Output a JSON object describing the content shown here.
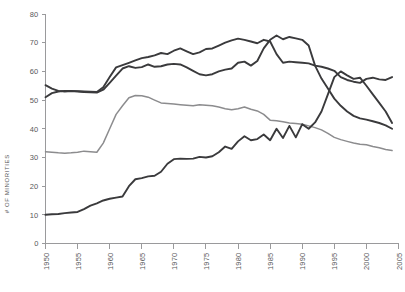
{
  "chart_data": {
    "type": "line",
    "title": "",
    "xlabel": "",
    "ylabel": "# OF MINORITIES",
    "xlim": [
      1950,
      2005
    ],
    "ylim": [
      0,
      80
    ],
    "grid": false,
    "legend": "none",
    "xticks": [
      "1950",
      "1955",
      "1960",
      "1965",
      "1970",
      "1975",
      "1980",
      "1985",
      "1990",
      "1995",
      "2000",
      "2005"
    ],
    "yticks": [
      "0",
      "10",
      "20",
      "30",
      "40",
      "50",
      "60",
      "70",
      "80"
    ],
    "x": [
      1950,
      1951,
      1952,
      1953,
      1954,
      1955,
      1956,
      1957,
      1958,
      1959,
      1960,
      1961,
      1962,
      1963,
      1964,
      1965,
      1966,
      1967,
      1968,
      1969,
      1970,
      1971,
      1972,
      1973,
      1974,
      1975,
      1976,
      1977,
      1978,
      1979,
      1980,
      1981,
      1982,
      1983,
      1984,
      1985,
      1986,
      1987,
      1988,
      1989,
      1990,
      1991,
      1992,
      1993,
      1994,
      1995,
      1996,
      1997,
      1998,
      1999,
      2000,
      2001,
      2002,
      2003,
      2004
    ],
    "series": [
      {
        "name": "series-a-dark",
        "color": "#3a3a3c",
        "values": [
          55.2,
          54.0,
          53.2,
          53.0,
          53.1,
          53.0,
          52.8,
          52.7,
          52.6,
          53.6,
          56.0,
          58.5,
          61.0,
          61.8,
          61.2,
          61.5,
          62.4,
          61.6,
          61.8,
          62.4,
          62.6,
          62.4,
          61.4,
          60.2,
          59.0,
          58.6,
          59.0,
          60.0,
          60.6,
          61.0,
          63.0,
          63.4,
          62.0,
          63.6,
          68.0,
          71.0,
          72.5,
          71.2,
          72.0,
          71.5,
          71.0,
          69.0,
          62.0,
          57.5,
          54.0,
          50.5,
          48.0,
          46.0,
          44.5,
          43.6,
          43.2,
          42.6,
          42.0,
          41.2,
          40.0
        ]
      },
      {
        "name": "series-b-dark",
        "color": "#3a3a3c",
        "values": [
          51.0,
          52.4,
          53.0,
          53.2,
          53.2,
          53.1,
          53.0,
          52.9,
          52.8,
          54.5,
          58.0,
          61.4,
          62.2,
          63.0,
          63.8,
          64.6,
          65.0,
          65.6,
          66.4,
          66.0,
          67.2,
          68.0,
          67.0,
          66.0,
          66.6,
          67.8,
          68.0,
          69.0,
          70.0,
          70.8,
          71.4,
          71.0,
          70.4,
          69.8,
          71.0,
          70.4,
          66.0,
          63.0,
          63.4,
          63.2,
          63.0,
          62.8,
          62.0,
          61.6,
          61.0,
          60.2,
          58.0,
          57.0,
          56.4,
          56.0,
          57.4,
          57.8,
          57.2,
          57.0,
          58.0
        ]
      },
      {
        "name": "series-c-gray",
        "color": "#8c8c8e",
        "values": [
          32.0,
          31.8,
          31.6,
          31.5,
          31.6,
          31.8,
          32.2,
          32.0,
          31.8,
          35.0,
          40.0,
          45.0,
          48.0,
          50.8,
          51.6,
          51.5,
          51.0,
          50.0,
          49.0,
          48.8,
          48.6,
          48.4,
          48.2,
          48.0,
          48.4,
          48.2,
          48.0,
          47.6,
          47.0,
          46.6,
          47.0,
          47.6,
          46.8,
          46.2,
          45.0,
          43.0,
          42.8,
          42.4,
          42.0,
          41.8,
          41.6,
          41.0,
          40.4,
          39.6,
          38.4,
          37.0,
          36.2,
          35.6,
          35.0,
          34.6,
          34.4,
          33.8,
          33.4,
          32.8,
          32.4
        ]
      },
      {
        "name": "series-d-bottom-dark",
        "color": "#3a3a3c",
        "values": [
          10.0,
          10.2,
          10.3,
          10.6,
          10.8,
          11.0,
          12.0,
          13.2,
          14.0,
          15.0,
          15.6,
          16.0,
          16.4,
          20.0,
          22.4,
          22.8,
          23.4,
          23.6,
          25.0,
          27.8,
          29.4,
          29.6,
          29.5,
          29.6,
          30.2,
          30.0,
          30.4,
          31.8,
          33.8,
          33.0,
          35.6,
          37.4,
          36.0,
          36.4,
          38.0,
          36.0,
          40.0,
          36.8,
          41.0,
          37.0,
          41.6,
          40.0,
          42.2,
          46.0,
          52.0,
          58.0,
          60.0,
          58.6,
          57.4,
          57.8,
          55.0,
          52.0,
          49.0,
          46.0,
          42.0
        ]
      }
    ]
  }
}
